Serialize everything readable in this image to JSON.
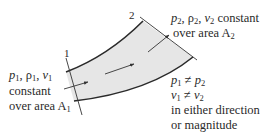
{
  "diagram": {
    "sections": [
      {
        "id": "1",
        "label": "1"
      },
      {
        "id": "2",
        "label": "2"
      }
    ],
    "inlet": {
      "line1": {
        "p": "p",
        "p_sub": "1",
        "sep1": ", ",
        "rho": "ρ",
        "rho_sub": "1",
        "sep2": ", ",
        "v": "v",
        "v_sub": "1"
      },
      "line2": "constant",
      "line3": {
        "text": "over area A",
        "sub": "1"
      }
    },
    "outlet": {
      "line1": {
        "p": "p",
        "p_sub": "2",
        "sep1": ", ",
        "rho": "ρ",
        "rho_sub": "2",
        "sep2": ", ",
        "v": "v",
        "v_sub": "2",
        "tail": " constant"
      },
      "line2": {
        "text": "over area A",
        "sub": "2"
      }
    },
    "comparison": {
      "line1": {
        "a": "p",
        "a_sub": "1",
        "op": " ≠ ",
        "b": "p",
        "b_sub": "2"
      },
      "line2": {
        "a": "v",
        "a_sub": "1",
        "op": " ≠ ",
        "b": "v",
        "b_sub": "2"
      },
      "line3": "in either direction",
      "line4": "or magnitude"
    },
    "colors": {
      "duct_fill": "#e6e6e6",
      "stroke": "#333333"
    }
  }
}
